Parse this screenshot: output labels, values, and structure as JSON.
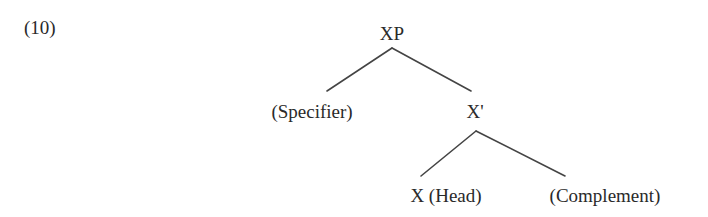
{
  "example": {
    "number_label": "(10)"
  },
  "tree": {
    "root": {
      "label": "XP",
      "x": 392,
      "y": 24
    },
    "nodes": [
      {
        "id": "specifier",
        "label": "(Specifier)",
        "x": 312,
        "y": 102
      },
      {
        "id": "x-bar",
        "label": "X'",
        "x": 475,
        "y": 102
      },
      {
        "id": "head",
        "label": "X (Head)",
        "x": 446,
        "y": 186
      },
      {
        "id": "complement",
        "label": "(Complement)",
        "x": 605,
        "y": 186
      }
    ],
    "edges": [
      {
        "from": "XP",
        "to": "(Specifier)",
        "x1": 392,
        "y1": 48,
        "x2": 327,
        "y2": 91
      },
      {
        "from": "XP",
        "to": "X'",
        "x1": 392,
        "y1": 48,
        "x2": 471,
        "y2": 91
      },
      {
        "from": "X'",
        "to": "X (Head)",
        "x1": 476,
        "y1": 131,
        "x2": 421,
        "y2": 176
      },
      {
        "from": "X'",
        "to": "(Complement)",
        "x1": 476,
        "y1": 131,
        "x2": 565,
        "y2": 176
      }
    ],
    "colors": {
      "text": "#2a2a2a",
      "branch": "#444444",
      "background": "#ffffff"
    }
  }
}
